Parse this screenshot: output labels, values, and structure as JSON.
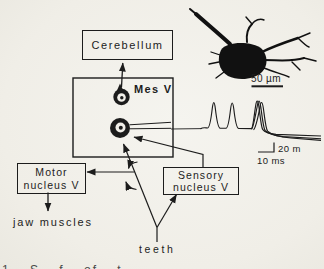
{
  "colors": {
    "ink": "#1c1c1c",
    "paper": "#f1efe9"
  },
  "boxes": {
    "cerebellum": {
      "label": "Cerebellum"
    },
    "motor_nucleus": {
      "line1": "Motor",
      "line2": "nucleus V"
    },
    "sensory_nucleus": {
      "line1": "Sensory",
      "line2": "nucleus V"
    }
  },
  "labels": {
    "mes_v": "Mes V",
    "jaw_muscles": "jaw muscles",
    "teeth": "teeth"
  },
  "scale_bars": {
    "micrograph_length": "50 µm",
    "amplitude": "20 m",
    "time": "10 ms"
  },
  "caption_fragment": "1 S f of t"
}
